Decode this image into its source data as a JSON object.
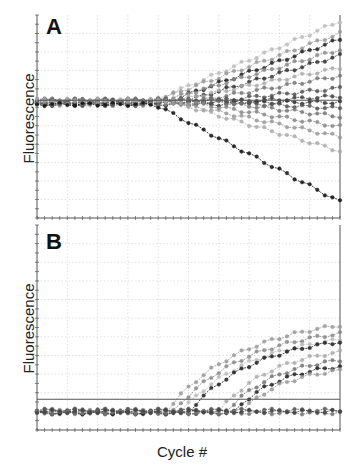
{
  "chart_data": [
    {
      "type": "line",
      "panel": "A",
      "title": "",
      "xlabel": "",
      "ylabel": "Fluorescence",
      "grid": true,
      "threshold_fraction": 0.58,
      "n_cycles": 40,
      "series_description": "Many amplification curves diverging after ~cycle 16; some rise, some fall below baseline",
      "series": [
        {
          "name": "rise-1",
          "end": 0.97,
          "start_cycle": 15,
          "color": "#bbbbbb"
        },
        {
          "name": "rise-2",
          "end": 0.91,
          "start_cycle": 15,
          "color": "#999999"
        },
        {
          "name": "rise-3",
          "end": 0.88,
          "start_cycle": 17,
          "color": "#222222"
        },
        {
          "name": "rise-4",
          "end": 0.83,
          "start_cycle": 16,
          "color": "#888888"
        },
        {
          "name": "rise-5",
          "end": 0.8,
          "start_cycle": 19,
          "color": "#333333"
        },
        {
          "name": "rise-6",
          "end": 0.74,
          "start_cycle": 17,
          "color": "#aaaaaa"
        },
        {
          "name": "rise-7",
          "end": 0.7,
          "start_cycle": 20,
          "color": "#777777"
        },
        {
          "name": "rise-8",
          "end": 0.64,
          "start_cycle": 22,
          "color": "#555555"
        },
        {
          "name": "flat-1",
          "end": 0.6,
          "start_cycle": 25,
          "color": "#444444"
        },
        {
          "name": "flat-2",
          "end": 0.57,
          "start_cycle": 25,
          "color": "#333333"
        },
        {
          "name": "flat-3",
          "end": 0.54,
          "start_cycle": 25,
          "color": "#555555"
        },
        {
          "name": "flat-4",
          "end": 0.5,
          "start_cycle": 24,
          "color": "#777777"
        },
        {
          "name": "fall-1",
          "end": 0.45,
          "start_cycle": 20,
          "color": "#888888"
        },
        {
          "name": "fall-2",
          "end": 0.4,
          "start_cycle": 18,
          "color": "#999999"
        },
        {
          "name": "fall-3",
          "end": 0.33,
          "start_cycle": 18,
          "color": "#aaaaaa"
        },
        {
          "name": "fall-4",
          "end": 0.08,
          "start_cycle": 15,
          "color": "#111111"
        }
      ]
    },
    {
      "type": "line",
      "panel": "B",
      "title": "",
      "xlabel": "Cycle #",
      "ylabel": "Fluorescence",
      "grid": true,
      "threshold_fraction": 0.15,
      "n_cycles": 40,
      "series_description": "Amplification curves rising from baseline after cycles ~18-30; remaining curves stay flat at baseline",
      "series": [
        {
          "name": "amp-1",
          "end": 0.51,
          "start_cycle": 17,
          "color": "#999999"
        },
        {
          "name": "amp-2",
          "end": 0.47,
          "start_cycle": 18,
          "color": "#888888"
        },
        {
          "name": "amp-3",
          "end": 0.44,
          "start_cycle": 19,
          "color": "#bbbbbb"
        },
        {
          "name": "amp-4",
          "end": 0.43,
          "start_cycle": 20,
          "color": "#222222"
        },
        {
          "name": "amp-5",
          "end": 0.38,
          "start_cycle": 24,
          "color": "#aaaaaa"
        },
        {
          "name": "amp-6",
          "end": 0.34,
          "start_cycle": 25,
          "color": "#777777"
        },
        {
          "name": "amp-7",
          "end": 0.31,
          "start_cycle": 26,
          "color": "#222222"
        },
        {
          "name": "amp-8",
          "end": 0.29,
          "start_cycle": 27,
          "color": "#999999"
        },
        {
          "name": "base-1",
          "end": 0.1,
          "start_cycle": 40,
          "color": "#555555"
        },
        {
          "name": "base-2",
          "end": 0.09,
          "start_cycle": 40,
          "color": "#777777"
        },
        {
          "name": "base-3",
          "end": 0.08,
          "start_cycle": 40,
          "color": "#444444"
        }
      ]
    }
  ],
  "labels": {
    "panel_a": "A",
    "panel_b": "B",
    "ylabel_a": "Fluorescence",
    "ylabel_b": "Fluorescence",
    "xlabel": "Cycle #"
  }
}
